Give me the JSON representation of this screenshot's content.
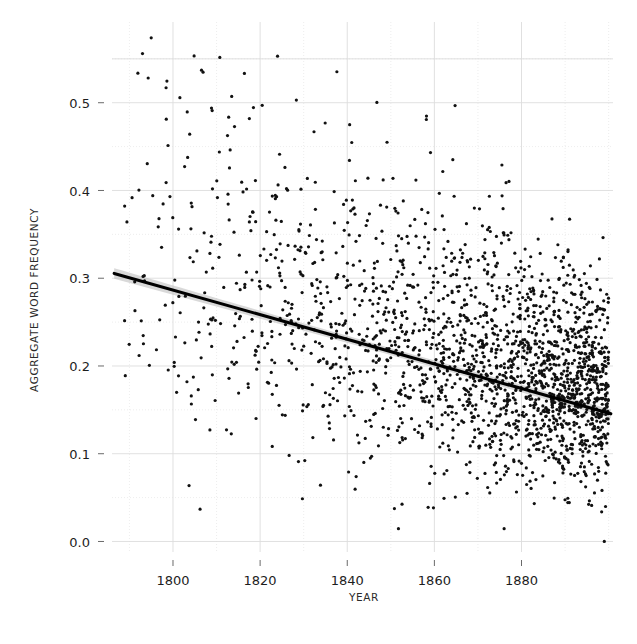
{
  "chart_data": {
    "type": "scatter",
    "title": "",
    "xlabel": "YEAR",
    "ylabel": "AGGREGATE WORD FREQUENCY",
    "xlim": [
      1786,
      1901
    ],
    "ylim": [
      -0.012,
      0.592
    ],
    "grid": true,
    "legend": null,
    "xticks": [
      1800,
      1820,
      1840,
      1860,
      1880
    ],
    "xtick_labels": [
      "1800",
      "1820",
      "1840",
      "1860",
      "1880"
    ],
    "yticks": [
      0.0,
      0.1,
      0.2,
      0.3,
      0.4,
      0.5
    ],
    "ytick_labels": [
      "0.0",
      "0.1",
      "0.2",
      "0.3",
      "0.4",
      "0.5"
    ],
    "x_minor_step": 10,
    "y_minor_step": 0.05,
    "marker": {
      "shape": "circle",
      "size_px": 1.6,
      "color": "#111111"
    },
    "trend": {
      "type": "linear-fit",
      "color": "#000000",
      "x_start": 1786.5,
      "y_start": 0.3055,
      "x_end": 1900.5,
      "y_end": 0.1455,
      "slope_per_year": -0.001404,
      "ci_band_color": "#b9b9b9",
      "ci_halfwidth_start": 0.006,
      "ci_halfwidth_mid": 0.0025,
      "ci_halfwidth_end": 0.005
    },
    "n_points": 2050,
    "point_density_note": "density increases strongly toward later years; vertical spread narrows over time",
    "series": [
      {
        "name": "aggregate word frequency by year",
        "density_profile": [
          {
            "year": 1788,
            "n": 7,
            "mean": 0.312,
            "sd": 0.098
          },
          {
            "year": 1792,
            "n": 10,
            "mean": 0.322,
            "sd": 0.105
          },
          {
            "year": 1796,
            "n": 14,
            "mean": 0.318,
            "sd": 0.1
          },
          {
            "year": 1800,
            "n": 17,
            "mean": 0.305,
            "sd": 0.098
          },
          {
            "year": 1804,
            "n": 20,
            "mean": 0.3,
            "sd": 0.095
          },
          {
            "year": 1808,
            "n": 23,
            "mean": 0.296,
            "sd": 0.094
          },
          {
            "year": 1812,
            "n": 26,
            "mean": 0.29,
            "sd": 0.092
          },
          {
            "year": 1816,
            "n": 29,
            "mean": 0.284,
            "sd": 0.09
          },
          {
            "year": 1820,
            "n": 32,
            "mean": 0.278,
            "sd": 0.089
          },
          {
            "year": 1824,
            "n": 35,
            "mean": 0.272,
            "sd": 0.087
          },
          {
            "year": 1828,
            "n": 38,
            "mean": 0.266,
            "sd": 0.085
          },
          {
            "year": 1832,
            "n": 42,
            "mean": 0.26,
            "sd": 0.083
          },
          {
            "year": 1836,
            "n": 46,
            "mean": 0.254,
            "sd": 0.081
          },
          {
            "year": 1840,
            "n": 50,
            "mean": 0.249,
            "sd": 0.079
          },
          {
            "year": 1844,
            "n": 55,
            "mean": 0.243,
            "sd": 0.077
          },
          {
            "year": 1848,
            "n": 60,
            "mean": 0.237,
            "sd": 0.075
          },
          {
            "year": 1852,
            "n": 66,
            "mean": 0.231,
            "sd": 0.073
          },
          {
            "year": 1856,
            "n": 72,
            "mean": 0.226,
            "sd": 0.071
          },
          {
            "year": 1860,
            "n": 80,
            "mean": 0.22,
            "sd": 0.069
          },
          {
            "year": 1864,
            "n": 90,
            "mean": 0.214,
            "sd": 0.067
          },
          {
            "year": 1868,
            "n": 100,
            "mean": 0.208,
            "sd": 0.065
          },
          {
            "year": 1872,
            "n": 112,
            "mean": 0.203,
            "sd": 0.063
          },
          {
            "year": 1876,
            "n": 124,
            "mean": 0.197,
            "sd": 0.061
          },
          {
            "year": 1880,
            "n": 138,
            "mean": 0.191,
            "sd": 0.059
          },
          {
            "year": 1884,
            "n": 152,
            "mean": 0.185,
            "sd": 0.057
          },
          {
            "year": 1888,
            "n": 168,
            "mean": 0.18,
            "sd": 0.055
          },
          {
            "year": 1892,
            "n": 184,
            "mean": 0.174,
            "sd": 0.054
          },
          {
            "year": 1896,
            "n": 200,
            "mean": 0.168,
            "sd": 0.052
          },
          {
            "year": 1900,
            "n": 210,
            "mean": 0.162,
            "sd": 0.051
          }
        ]
      }
    ],
    "notable_points": [
      {
        "year": 1795,
        "value": 0.574
      },
      {
        "year": 1793,
        "value": 0.556
      },
      {
        "year": 1824,
        "value": 0.553
      },
      {
        "year": 1899,
        "value": 0.0
      }
    ]
  },
  "axes": {
    "x_axis_title": "YEAR",
    "y_axis_title": "AGGREGATE WORD FREQUENCY"
  }
}
